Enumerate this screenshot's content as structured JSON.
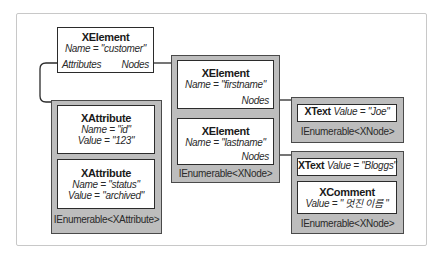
{
  "root_element": {
    "type": "XElement",
    "name_prop": "Name = \"customer\"",
    "attributes_port": "Attributes",
    "nodes_port": "Nodes"
  },
  "attributes_collection": {
    "label": "IEnumerable<XAttribute>",
    "items": [
      {
        "type": "XAttribute",
        "name_prop": "Name = \"id\"",
        "value_prop": "Value = \"123\""
      },
      {
        "type": "XAttribute",
        "name_prop": "Name = \"status\"",
        "value_prop": "Value = \"archived\""
      }
    ]
  },
  "nodes_collection": {
    "label": "IEnumerable<XNode>",
    "items": [
      {
        "type": "XElement",
        "name_prop": "Name = \"firstname\"",
        "nodes_port": "Nodes"
      },
      {
        "type": "XElement",
        "name_prop": "Name = \"lastname\"",
        "nodes_port": "Nodes"
      }
    ]
  },
  "firstname_nodes": {
    "label": "IEnumerable<XNode>",
    "items": [
      {
        "type": "XText",
        "value_prop": "Value = \"Joe\""
      }
    ]
  },
  "lastname_nodes": {
    "label": "IEnumerable<XNode>",
    "items": [
      {
        "type": "XText",
        "value_prop": "Value = \"Bloggs\""
      },
      {
        "type": "XComment",
        "value_prop": "Value = \" 멋진 이름 \""
      }
    ]
  },
  "colors": {
    "collection_fill": "#bdbdbd",
    "node_fill": "#ffffff",
    "border": "#2b2b2b",
    "frame": "#c8c8c8"
  }
}
